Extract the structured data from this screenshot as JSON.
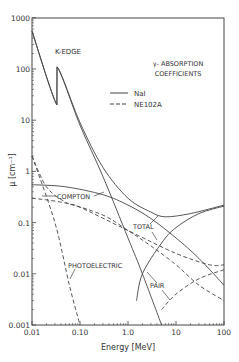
{
  "chart_data": {
    "type": "line",
    "title": "γ- ABSORPTION COEFFICIENTS",
    "title_lines": [
      "γ- ABSORPTION",
      "COEFFICIENTS"
    ],
    "xlabel": "Energy [MeV]",
    "ylabel": "μ [cm⁻¹]",
    "xscale": "log",
    "yscale": "log",
    "xlim": [
      0.01,
      120
    ],
    "ylim": [
      0.001,
      1000
    ],
    "x_ticks": [
      "0.01",
      "0.10",
      "1.0",
      "10",
      "100"
    ],
    "y_ticks": [
      "0.001",
      "0.01",
      "0.1",
      "1",
      "10",
      "100",
      "1000"
    ],
    "grid": false,
    "legend": [
      {
        "label": "NaI",
        "style": "solid"
      },
      {
        "label": "NE102A",
        "style": "dashed"
      }
    ],
    "annotations": [
      "K-EDGE",
      "COMPTON",
      "TOTAL",
      "PHOTOELECTRIC",
      "PAIR"
    ],
    "series": [
      {
        "name": "NaI total",
        "style": "solid",
        "points": [
          [
            0.01,
            550
          ],
          [
            0.033,
            20
          ],
          [
            0.0332,
            110
          ],
          [
            0.1,
            9
          ],
          [
            0.3,
            1.2
          ],
          [
            1,
            0.3
          ],
          [
            3,
            0.16
          ],
          [
            6,
            0.13
          ],
          [
            20,
            0.15
          ],
          [
            100,
            0.22
          ]
        ]
      },
      {
        "name": "NaI photoelectric",
        "style": "solid",
        "points": [
          [
            0.01,
            550
          ],
          [
            0.033,
            20
          ],
          [
            0.0332,
            110
          ],
          [
            0.1,
            8
          ],
          [
            0.3,
            0.8
          ],
          [
            1,
            0.05
          ],
          [
            2,
            0.01
          ],
          [
            5,
            0.001
          ]
        ]
      },
      {
        "name": "NaI compton",
        "style": "solid",
        "points": [
          [
            0.01,
            0.55
          ],
          [
            0.05,
            0.5
          ],
          [
            0.3,
            0.35
          ],
          [
            1,
            0.22
          ],
          [
            3,
            0.12
          ],
          [
            10,
            0.05
          ],
          [
            30,
            0.02
          ],
          [
            100,
            0.006
          ]
        ]
      },
      {
        "name": "NaI pair",
        "style": "solid",
        "points": [
          [
            1.5,
            0.003
          ],
          [
            2,
            0.01
          ],
          [
            5,
            0.04
          ],
          [
            10,
            0.08
          ],
          [
            30,
            0.15
          ],
          [
            100,
            0.21
          ]
        ]
      },
      {
        "name": "NE102A total",
        "style": "dashed",
        "points": [
          [
            0.01,
            2
          ],
          [
            0.02,
            0.5
          ],
          [
            0.05,
            0.25
          ],
          [
            0.1,
            0.2
          ],
          [
            1,
            0.07
          ],
          [
            10,
            0.025
          ],
          [
            50,
            0.015
          ],
          [
            100,
            0.015
          ]
        ]
      },
      {
        "name": "NE102A photoelectric",
        "style": "dashed",
        "points": [
          [
            0.01,
            2
          ],
          [
            0.03,
            0.1
          ],
          [
            0.06,
            0.006
          ],
          [
            0.1,
            0.001
          ]
        ]
      },
      {
        "name": "NE102A compton",
        "style": "dashed",
        "points": [
          [
            0.01,
            0.3
          ],
          [
            0.05,
            0.24
          ],
          [
            0.3,
            0.14
          ],
          [
            1,
            0.07
          ],
          [
            3,
            0.035
          ],
          [
            10,
            0.015
          ],
          [
            30,
            0.006
          ],
          [
            100,
            0.003
          ]
        ]
      },
      {
        "name": "NE102A pair",
        "style": "dashed",
        "points": [
          [
            5,
            0.002
          ],
          [
            10,
            0.004
          ],
          [
            30,
            0.008
          ],
          [
            100,
            0.012
          ]
        ]
      }
    ]
  }
}
